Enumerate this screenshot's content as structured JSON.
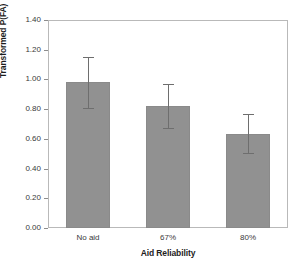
{
  "chart_data": {
    "type": "bar",
    "title": "",
    "xlabel": "Aid Reliability",
    "ylabel": "Transformed P(FA)",
    "categories": [
      "No aid",
      "67%",
      "80%"
    ],
    "values": [
      0.98,
      0.82,
      0.635
    ],
    "errors": [
      0.17,
      0.15,
      0.13
    ],
    "error_upper": [
      1.15,
      0.97,
      0.765
    ],
    "error_lower": [
      0.81,
      0.67,
      0.505
    ],
    "ylim": [
      0.0,
      1.4
    ],
    "ytick_labels": [
      "0.00",
      "0.20",
      "0.40",
      "0.60",
      "0.80",
      "1.00",
      "1.20",
      "1.40"
    ],
    "ytick_values": [
      0.0,
      0.2,
      0.4,
      0.6,
      0.8,
      1.0,
      1.2,
      1.4
    ],
    "grid": false,
    "legend": null,
    "bar_color": "#919191",
    "bar_edge_color": "#8a8a8a",
    "error_color": "#6e6e6e",
    "frame_color": "#b9b9b9",
    "text_color": "#3a3a3a",
    "title_color": "#1d1d1d"
  }
}
